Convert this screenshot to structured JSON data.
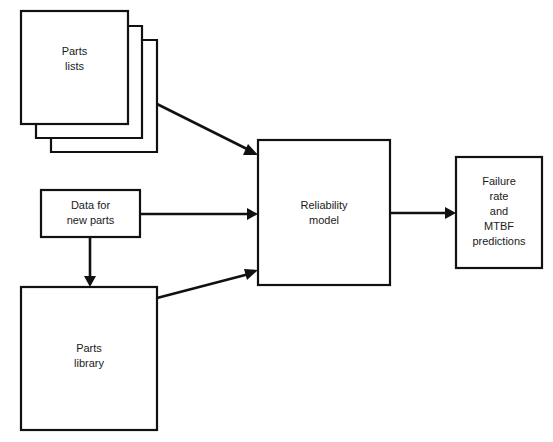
{
  "diagram": {
    "type": "flowchart",
    "background_color": "#ffffff",
    "line_color": "#111111",
    "fill_color": "#ffffff",
    "nodes": [
      {
        "id": "parts-lists",
        "label": "Parts\nlists",
        "shape": "stacked-rectangle",
        "stack_count": 3,
        "x": 21,
        "y": 11,
        "width": 107,
        "height": 113
      },
      {
        "id": "data-for-new-parts",
        "label": "Data for\nnew parts",
        "shape": "rectangle",
        "x": 41,
        "y": 190,
        "width": 99,
        "height": 47
      },
      {
        "id": "parts-library",
        "label": "Parts\nlibrary",
        "shape": "rectangle",
        "x": 21,
        "y": 287,
        "width": 136,
        "height": 143
      },
      {
        "id": "reliability-model",
        "label": "Reliability\nmodel",
        "shape": "rectangle",
        "x": 258,
        "y": 140,
        "width": 132,
        "height": 145
      },
      {
        "id": "failure-rate-mtbf-predictions",
        "label": "Failure\nrate\nand\nMTBF\npredictions",
        "shape": "rectangle",
        "x": 456,
        "y": 157,
        "width": 86,
        "height": 111
      }
    ],
    "edges": [
      {
        "id": "parts-lists-to-model",
        "from": "parts-lists",
        "to": "reliability-model",
        "style": "diagonal-down-right",
        "arrowhead": "solid"
      },
      {
        "id": "data-for-new-parts-to-model",
        "from": "data-for-new-parts",
        "to": "reliability-model",
        "style": "horizontal",
        "arrowhead": "solid"
      },
      {
        "id": "data-for-new-parts-to-library",
        "from": "data-for-new-parts",
        "to": "parts-library",
        "style": "vertical-down",
        "arrowhead": "solid"
      },
      {
        "id": "parts-library-to-model",
        "from": "parts-library",
        "to": "reliability-model",
        "style": "diagonal-up-right",
        "arrowhead": "solid"
      },
      {
        "id": "model-to-predictions",
        "from": "reliability-model",
        "to": "failure-rate-mtbf-predictions",
        "style": "horizontal",
        "arrowhead": "solid"
      }
    ]
  }
}
